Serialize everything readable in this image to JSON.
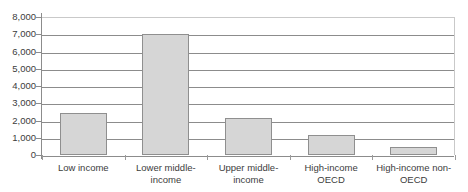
{
  "chart_data": {
    "type": "bar",
    "title": "",
    "xlabel": "",
    "ylabel": "",
    "categories": [
      "Low income",
      "Lower middle-income",
      "Upper middle-income",
      "High-income OECD",
      "High-income non-OECD"
    ],
    "values": [
      2430,
      7000,
      2150,
      1150,
      450
    ],
    "ylim": [
      0,
      8000
    ],
    "ytick_step": 1000,
    "ytick_labels": [
      "8,000",
      "7,000",
      "6,000",
      "5,000",
      "4,000",
      "3,000",
      "2,000",
      "1,000",
      "0"
    ],
    "ytick_values": [
      8000,
      7000,
      6000,
      5000,
      4000,
      3000,
      2000,
      1000,
      0
    ],
    "grid": true,
    "legend": false,
    "legend_position": "none",
    "bar_fill_color": "#d6d6d6",
    "bar_border_color": "#8f8f8f",
    "gridline_color": "#8c8c8c",
    "axis_color": "#8c8c8c"
  },
  "x_label_lines": [
    [
      "Low income"
    ],
    [
      "Lower middle-",
      "income"
    ],
    [
      "Upper middle-",
      "income"
    ],
    [
      "High-income",
      "OECD"
    ],
    [
      "High-income non-",
      "OECD"
    ]
  ]
}
